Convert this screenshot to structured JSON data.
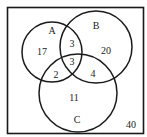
{
  "diagram": {
    "type": "venn-3",
    "universe_count": "40",
    "sets": {
      "A": {
        "label": "A"
      },
      "B": {
        "label": "B"
      },
      "C": {
        "label": "C"
      }
    },
    "regions": {
      "A_only": "17",
      "B_only": "20",
      "C_only": "11",
      "A_and_B_only": "3",
      "A_and_C_only": "2",
      "B_and_C_only": "4",
      "A_and_B_and_C": "3"
    },
    "colors": {
      "stroke": "#1a1a1a",
      "background": "#ffffff",
      "text": "#222222"
    }
  }
}
